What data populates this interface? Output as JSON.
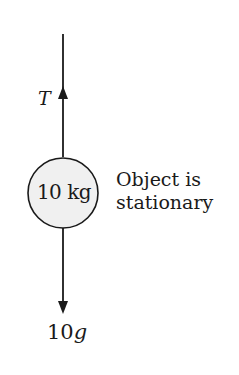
{
  "diagram": {
    "type": "free-body-diagram",
    "forces": [
      {
        "label": "T",
        "direction": "up"
      },
      {
        "label": "10g",
        "label_number": "10",
        "label_symbol": "g",
        "direction": "down"
      }
    ],
    "object": {
      "mass_label": "10 kg"
    },
    "note": {
      "line1": "Object is",
      "line2": "stationary"
    },
    "colors": {
      "line": "#1a1a1a",
      "object_fill": "#f0f0f0",
      "background": "#ffffff"
    }
  }
}
